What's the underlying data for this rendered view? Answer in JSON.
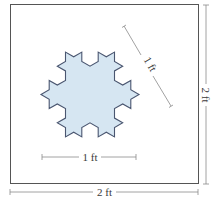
{
  "figure": {
    "square_label_width": "2 ft",
    "square_label_height": "2 ft",
    "snowflake_label_width": "1 ft",
    "snowflake_label_side": "1 ft",
    "colors": {
      "snowflake_fill": "#d6e6f2",
      "snowflake_stroke": "#4a5670",
      "square_stroke": "#555555",
      "dimension_line": "#8a8a8a",
      "label_text": "#3a3a3a"
    }
  }
}
